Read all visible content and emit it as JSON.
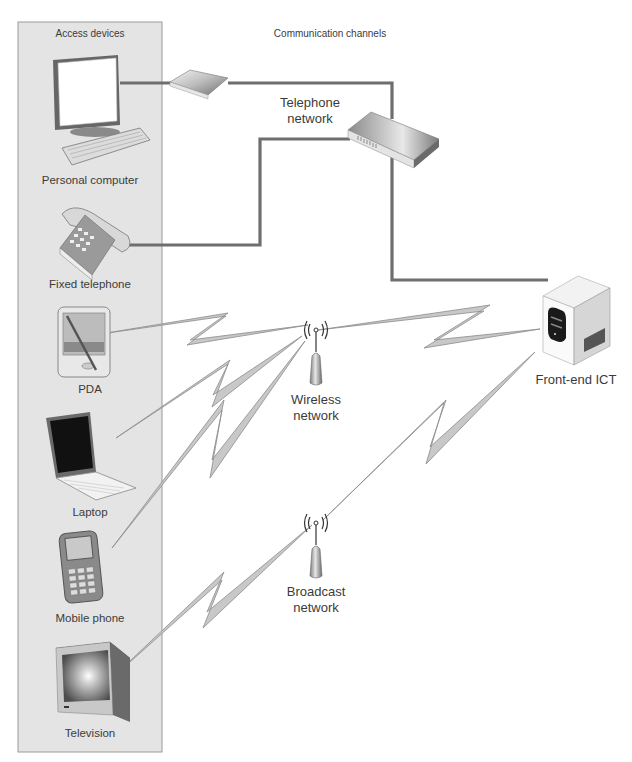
{
  "panel": {
    "title": "Access devices",
    "background": "#e4e4e4",
    "border": "#9a9a9a"
  },
  "channels_title": "Communication channels",
  "devices": [
    {
      "id": "pc",
      "label": "Personal computer",
      "icon": "desktop-computer-icon"
    },
    {
      "id": "phone",
      "label": "Fixed telephone",
      "icon": "desk-telephone-icon"
    },
    {
      "id": "pda",
      "label": "PDA",
      "icon": "pda-icon"
    },
    {
      "id": "laptop",
      "label": "Laptop",
      "icon": "laptop-icon"
    },
    {
      "id": "mobile",
      "label": "Mobile phone",
      "icon": "mobile-phone-icon"
    },
    {
      "id": "tv",
      "label": "Television",
      "icon": "television-icon"
    }
  ],
  "networks": [
    {
      "id": "telephone",
      "label": "Telephone\nnetwork",
      "icon": "network-switch-icon"
    },
    {
      "id": "wireless",
      "label": "Wireless\nnetwork",
      "icon": "wireless-antenna-icon"
    },
    {
      "id": "broadcast",
      "label": "Broadcast\nnetwork",
      "icon": "broadcast-antenna-icon"
    }
  ],
  "server": {
    "label": "Front-end ICT",
    "icon": "server-tower-icon"
  },
  "colors": {
    "wire": "#6e6e6e",
    "bolt_fill": "#c8c8c8",
    "bolt_stroke": "#8c8c8c",
    "device_dark": "#555555"
  }
}
